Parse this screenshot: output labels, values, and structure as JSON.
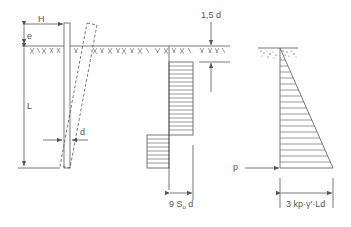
{
  "diagram": {
    "colors": {
      "line": "#555555",
      "hatch": "#666666",
      "background": "#ffffff"
    },
    "pile_elevation": {
      "load_label": "H",
      "eccentricity_label": "e",
      "embedded_length_label": "L",
      "diameter_label": "d"
    },
    "cohesive_soil_pressure": {
      "top_offset_label": "1,5 d",
      "width_label_main": "9 S",
      "width_label_sub": "u",
      "width_label_tail": " d"
    },
    "cohesionless_soil_pressure": {
      "resultant_label": "p",
      "base_width_label": "3 kp·γ'·Ld"
    }
  }
}
